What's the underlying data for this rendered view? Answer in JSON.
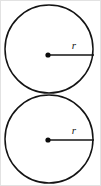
{
  "figure": {
    "background_color": "#ffffff",
    "stroke_color": "#141414",
    "label_color": "#171717",
    "dot_color": "#0b0b0b",
    "canvas": {
      "width": 101,
      "height": 186
    },
    "shapes": [
      {
        "id": "top-circle",
        "type": "circle",
        "center": {
          "x": 49,
          "y": 49
        },
        "radius": 44,
        "center_dot": {
          "x": 48,
          "y": 55,
          "radius": 2.6
        },
        "radius_line": {
          "x1": 48,
          "y1": 55,
          "x2": 94,
          "y2": 55
        },
        "label": {
          "text": "r",
          "x": 74,
          "y": 49
        }
      },
      {
        "id": "bottom-circle",
        "type": "circle",
        "center": {
          "x": 49,
          "y": 139
        },
        "radius": 44,
        "center_dot": {
          "x": 48,
          "y": 140,
          "radius": 2.6
        },
        "radius_line": {
          "x1": 48,
          "y1": 140,
          "x2": 94,
          "y2": 140
        },
        "label": {
          "text": "r",
          "x": 74,
          "y": 134
        }
      }
    ],
    "labels": {
      "top_radius": "r",
      "bottom_radius": "r"
    }
  }
}
